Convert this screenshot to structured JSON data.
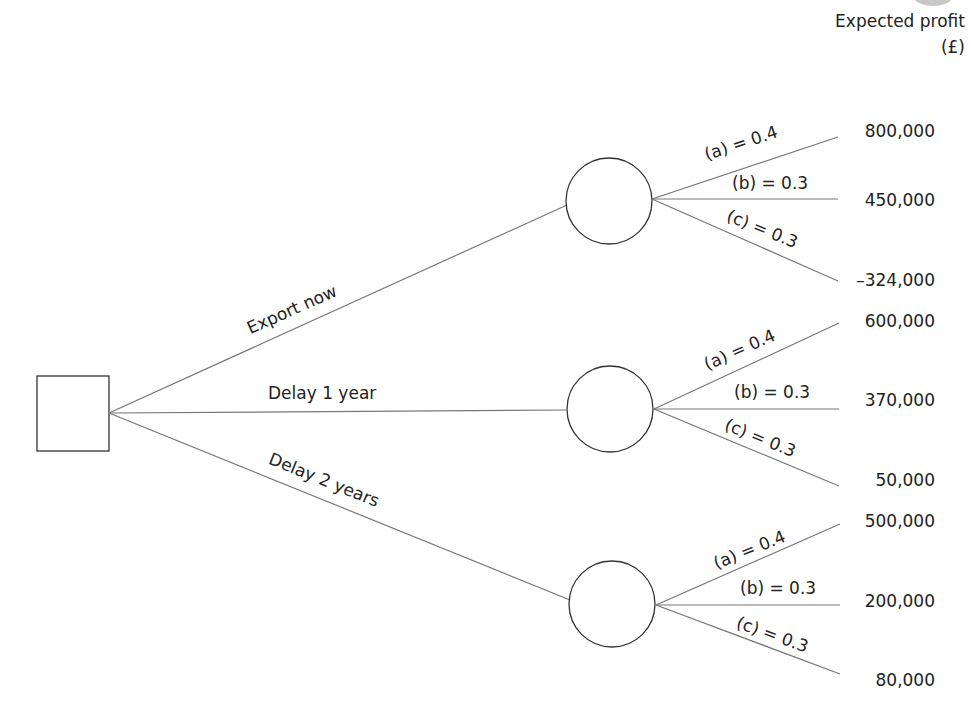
{
  "header": {
    "line1": "Expected profit",
    "line2": "(£)"
  },
  "decision_node": {
    "type": "square"
  },
  "branches": [
    {
      "label": "Export now",
      "outcomes": [
        {
          "label": "(a) = 0.4",
          "value": "800,000"
        },
        {
          "label": "(b) = 0.3",
          "value": "450,000"
        },
        {
          "label": "(c) = 0.3",
          "value": "–324,000"
        }
      ]
    },
    {
      "label": "Delay 1 year",
      "outcomes": [
        {
          "label": "(a) = 0.4",
          "value": "600,000"
        },
        {
          "label": "(b) = 0.3",
          "value": "370,000"
        },
        {
          "label": "(c) = 0.3",
          "value": "50,000"
        }
      ]
    },
    {
      "label": "Delay 2 years",
      "outcomes": [
        {
          "label": "(a) = 0.4",
          "value": "500,000"
        },
        {
          "label": "(b) = 0.3",
          "value": "200,000"
        },
        {
          "label": "(c) = 0.3",
          "value": "80,000"
        }
      ]
    }
  ],
  "colors": {
    "line": "#777777",
    "shape": "#333333",
    "text": "#222222"
  }
}
